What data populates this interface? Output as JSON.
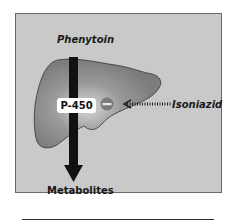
{
  "diagram": {
    "labels": {
      "input_drug": "Phenytoin",
      "enzyme": "P-450",
      "inhibitor": "Isoniazid",
      "output": "Metabolites"
    },
    "organ": "liver",
    "inhibition_symbol": "minus",
    "colors": {
      "panel": "#c9c9c9",
      "liver": "#8a8a8a",
      "inhibitor_circle": "#7a7a7a",
      "arrow": "#111111"
    }
  }
}
